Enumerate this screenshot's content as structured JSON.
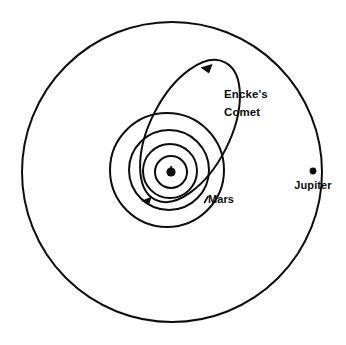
{
  "figure": {
    "type": "orbital-diagram",
    "background_color": "#ffffff",
    "line_color": "#0d0d0d",
    "width": 346,
    "height": 345
  },
  "labels": {
    "comet_line1": "Encke's",
    "comet_line2": "Comet",
    "mars": "Mars",
    "jupiter": "Jupiter"
  },
  "chart_data": {
    "type": "scatter",
    "title": "",
    "xlabel": "",
    "ylabel": "",
    "center": {
      "x": 171,
      "y": 172
    },
    "orbits": [
      {
        "name": "Mercury",
        "kind": "circle",
        "radius": 16,
        "cx": 171,
        "cy": 172
      },
      {
        "name": "Venus",
        "kind": "circle",
        "radius": 27,
        "cx": 170,
        "cy": 171
      },
      {
        "name": "Earth",
        "kind": "circle",
        "radius": 40,
        "cx": 169,
        "cy": 170
      },
      {
        "name": "Mars",
        "kind": "circle",
        "radius": 57,
        "cx": 167,
        "cy": 170
      },
      {
        "name": "Jupiter",
        "kind": "circle",
        "radius": 150,
        "cx": 172,
        "cy": 172
      },
      {
        "name": "Encke's Comet",
        "kind": "ellipse",
        "semi_major": 77,
        "semi_minor": 40,
        "cx": 190,
        "cy": 131,
        "rotation_deg": -63
      }
    ],
    "bodies": [
      {
        "name": "Sun",
        "x": 171,
        "y": 172,
        "radius": 5.2,
        "marker": "filled-blob"
      },
      {
        "name": "Jupiter",
        "x": 313,
        "y": 171,
        "radius": 3.4,
        "marker": "dot"
      }
    ],
    "annotations": [
      {
        "text": "Encke's Comet",
        "x": 224,
        "y": 98,
        "lines": [
          "Encke's",
          "Comet"
        ]
      },
      {
        "text": "Mars",
        "x": 206,
        "y": 199
      },
      {
        "text": "Jupiter",
        "x": 313,
        "y": 187
      }
    ],
    "direction_arrows": [
      {
        "on": "Encke's Comet",
        "x": 207,
        "y": 68,
        "direction": "counterclockwise"
      },
      {
        "on": "Mars",
        "x": 147,
        "y": 200,
        "direction": "counterclockwise"
      }
    ],
    "grid": false,
    "legend": "none"
  }
}
